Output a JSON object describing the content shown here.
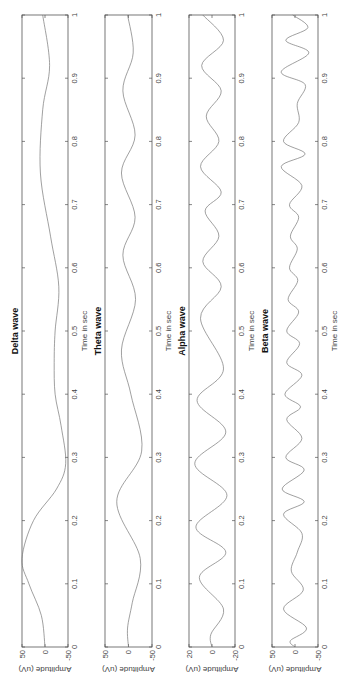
{
  "chart_data": [
    {
      "type": "line",
      "title": "Delta wave",
      "xlabel": "Time in sec",
      "ylabel": "Amplitude (uV)",
      "xlim": [
        0,
        1
      ],
      "ylim": [
        -50,
        50
      ],
      "xticks": [
        "0",
        "0.1",
        "0.2",
        "0.3",
        "0.4",
        "0.5",
        "0.6",
        "0.7",
        "0.8",
        "0.9",
        "1"
      ],
      "yticks": [
        "-50",
        "0",
        "50"
      ],
      "x": [
        0,
        0.05,
        0.1,
        0.14,
        0.2,
        0.25,
        0.29,
        0.35,
        0.4,
        0.45,
        0.5,
        0.57,
        0.65,
        0.75,
        0.85,
        0.92,
        1.0
      ],
      "values": [
        0,
        8,
        35,
        50,
        25,
        -25,
        -45,
        -35,
        -22,
        -20,
        -22,
        -30,
        -12,
        10,
        5,
        -10,
        5
      ]
    },
    {
      "type": "line",
      "title": "Theta wave",
      "xlabel": "Time in sec",
      "ylabel": "Amplitude (uV)",
      "xlim": [
        0,
        1
      ],
      "ylim": [
        -50,
        50
      ],
      "xticks": [
        "0",
        "0.1",
        "0.2",
        "0.3",
        "0.4",
        "0.5",
        "0.6",
        "0.7",
        "0.8",
        "0.9",
        "1"
      ],
      "yticks": [
        "-50",
        "0",
        "50"
      ],
      "x": [
        0,
        0.03,
        0.07,
        0.14,
        0.23,
        0.31,
        0.4,
        0.47,
        0.55,
        0.62,
        0.68,
        0.75,
        0.81,
        0.88,
        0.94,
        1.0
      ],
      "values": [
        0,
        2,
        -8,
        -25,
        25,
        -28,
        -5,
        15,
        -15,
        12,
        -14,
        15,
        -14,
        12,
        -10,
        2
      ]
    },
    {
      "type": "line",
      "title": "Alpha wave",
      "xlabel": "Time in sec",
      "ylabel": "Amplitude (uV)",
      "xlim": [
        0,
        1
      ],
      "ylim": [
        -20,
        20
      ],
      "xticks": [
        "0",
        "0.1",
        "0.2",
        "0.3",
        "0.4",
        "0.5",
        "0.6",
        "0.7",
        "0.8",
        "0.9",
        "1"
      ],
      "yticks": [
        "-20",
        "0",
        "20"
      ],
      "x": [
        0,
        0.02,
        0.06,
        0.11,
        0.15,
        0.19,
        0.24,
        0.29,
        0.34,
        0.39,
        0.44,
        0.52,
        0.57,
        0.61,
        0.65,
        0.69,
        0.72,
        0.76,
        0.8,
        0.84,
        0.88,
        0.92,
        0.96,
        1.0
      ],
      "values": [
        0,
        1,
        -10,
        11,
        -12,
        14,
        -13,
        15,
        -12,
        13,
        -10,
        10,
        -8,
        8,
        -6,
        6,
        -8,
        10,
        -6,
        5,
        -8,
        9,
        -10,
        8
      ]
    },
    {
      "type": "line",
      "title": "Beta wave",
      "xlabel": "Time in sec",
      "ylabel": "Amplitude (uV)",
      "xlim": [
        0,
        1
      ],
      "ylim": [
        -50,
        50
      ],
      "xticks": [
        "0",
        "0.1",
        "0.2",
        "0.3",
        "0.4",
        "0.5",
        "0.6",
        "0.7",
        "0.8",
        "0.9",
        "1"
      ],
      "yticks": [
        "-50",
        "0",
        "50"
      ],
      "x": [
        0,
        0.01,
        0.03,
        0.06,
        0.09,
        0.12,
        0.15,
        0.18,
        0.21,
        0.23,
        0.25,
        0.28,
        0.3,
        0.33,
        0.36,
        0.38,
        0.4,
        0.43,
        0.45,
        0.48,
        0.5,
        0.53,
        0.55,
        0.58,
        0.6,
        0.63,
        0.65,
        0.68,
        0.7,
        0.73,
        0.76,
        0.78,
        0.8,
        0.83,
        0.86,
        0.89,
        0.91,
        0.94,
        0.96,
        0.98,
        1.0
      ],
      "values": [
        0,
        10,
        -25,
        25,
        -18,
        8,
        -5,
        -15,
        25,
        -20,
        28,
        -20,
        20,
        -15,
        18,
        -12,
        22,
        -15,
        18,
        -10,
        18,
        -8,
        15,
        -6,
        12,
        -5,
        10,
        -8,
        12,
        -15,
        30,
        -22,
        25,
        -8,
        -5,
        -22,
        30,
        -30,
        20,
        -28,
        5
      ]
    }
  ],
  "figure": {
    "rotation_deg": -90,
    "panels": [
      {
        "title": "Delta wave",
        "xlabel": "Time in sec",
        "ylabel": "Amplitude (uV)"
      },
      {
        "title": "Theta wave",
        "xlabel": "Time in sec",
        "ylabel": "Amplitude (uV)"
      },
      {
        "title": "Alpha wave",
        "xlabel": "Time in sec",
        "ylabel": "Amplitude (uV)"
      },
      {
        "title": "Beta wave",
        "xlabel": "Time in sec",
        "ylabel": "Amplitude (uV)"
      }
    ]
  }
}
